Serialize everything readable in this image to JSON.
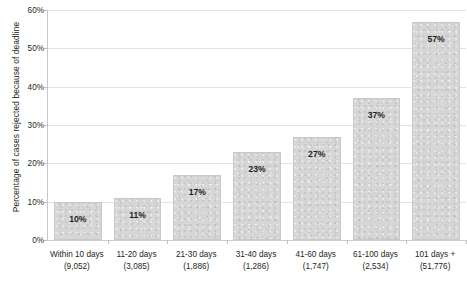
{
  "chart_data": {
    "type": "bar",
    "title": "",
    "subtitle": "",
    "xlabel": "",
    "ylabel": "Percentage of cases rejected because of deadline",
    "ylim": [
      0,
      60
    ],
    "ytick_step": 10,
    "grid": true,
    "legend": false,
    "value_suffix": "%",
    "bar_color": "#d6d6d6",
    "bar_border_color": "#c9c9c9",
    "gridline_color": "#e2e2e2",
    "axis_color": "#c8c8c8",
    "text_color": "#231f20",
    "categories": [
      "Within 10 days",
      "11-20 days",
      "21-30 days",
      "31-40 days",
      "41-60 days",
      "61-100 days",
      "101 days +"
    ],
    "category_counts": [
      "(9,052)",
      "(3,085)",
      "(1,886)",
      "(1,286)",
      "(1,747)",
      "(2,534)",
      "(51,776)"
    ],
    "values": [
      10,
      11,
      17,
      23,
      27,
      37,
      57
    ],
    "value_labels": [
      "10%",
      "11%",
      "17%",
      "23%",
      "27%",
      "37%",
      "57%"
    ],
    "ytick_labels": [
      "0%",
      "10%",
      "20%",
      "30%",
      "40%",
      "50%",
      "60%"
    ],
    "ytick_values": [
      0,
      10,
      20,
      30,
      40,
      50,
      60
    ]
  }
}
